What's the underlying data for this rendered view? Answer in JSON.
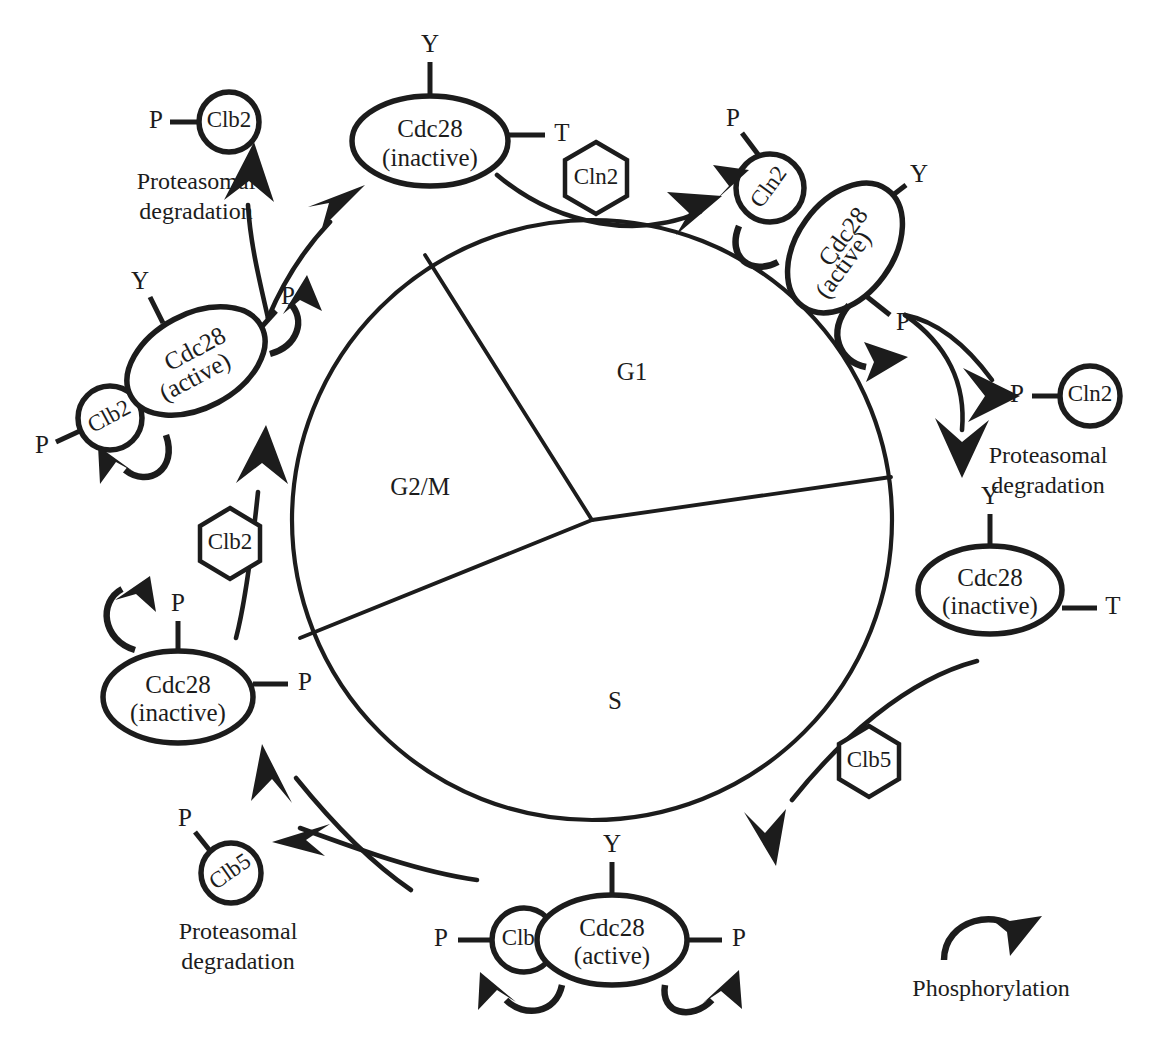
{
  "figure": {
    "type": "cell-cycle-regulation-diagram",
    "organism_cycle": "yeast cell cycle (Cdc28 / cyclin regulation)",
    "background_color": "#ffffff",
    "ink_color": "#1c1c1c"
  },
  "cycle_wheel": {
    "center": [
      592,
      520
    ],
    "radius": 300,
    "phases": [
      {
        "id": "g1",
        "label": "G1",
        "x": 632,
        "y": 374
      },
      {
        "id": "g2m",
        "label": "G2/M",
        "x": 420,
        "y": 489
      },
      {
        "id": "s",
        "label": "S",
        "x": 615,
        "y": 703
      }
    ],
    "divider_endpoints": [
      [
        425,
        255
      ],
      [
        891,
        477
      ],
      [
        300,
        638
      ]
    ]
  },
  "complexes": [
    {
      "id": "cdc28-inactive-top",
      "kinase_label": "Cdc28",
      "state_label": "(inactive)",
      "center": [
        430,
        141
      ],
      "rx": 78,
      "ry": 45,
      "rotate": 0,
      "residues": [
        {
          "label": "Y",
          "position": "top"
        },
        {
          "label": "T",
          "position": "right"
        }
      ],
      "cyclin": null
    },
    {
      "id": "cln2-cdc28-active",
      "kinase_label": "Cdc28",
      "state_label": "(active)",
      "center": [
        845,
        248
      ],
      "rx": 72,
      "ry": 48,
      "rotate": -54,
      "residues": [
        {
          "label": "Y",
          "position": "upper-right"
        },
        {
          "label": "P",
          "position": "lower-right"
        }
      ],
      "cyclin": {
        "label": "Cln2",
        "center": [
          770,
          188
        ],
        "r": 34,
        "tag": {
          "label": "P",
          "x": 735,
          "y": 123
        }
      }
    },
    {
      "id": "cdc28-inactive-right",
      "kinase_label": "Cdc28",
      "state_label": "(inactive)",
      "center": [
        990,
        590
      ],
      "rx": 72,
      "ry": 44,
      "rotate": 0,
      "residues": [
        {
          "label": "Y",
          "position": "top"
        },
        {
          "label": "T",
          "position": "right"
        }
      ],
      "cyclin": null
    },
    {
      "id": "clb5-cdc28-active",
      "kinase_label": "Cdc28",
      "state_label": "(active)",
      "center": [
        612,
        940
      ],
      "rx": 75,
      "ry": 45,
      "rotate": 0,
      "residues": [
        {
          "label": "Y",
          "position": "top"
        },
        {
          "label": "P",
          "position": "right"
        }
      ],
      "cyclin": {
        "label": "Clb5",
        "center": [
          524,
          940
        ],
        "r": 32,
        "tag": {
          "label": "P",
          "x": 440,
          "y": 940
        }
      }
    },
    {
      "id": "cdc28-inactive-left",
      "kinase_label": "Cdc28",
      "state_label": "(inactive)",
      "center": [
        178,
        697
      ],
      "rx": 75,
      "ry": 46,
      "rotate": 0,
      "residues": [
        {
          "label": "P",
          "position": "top"
        },
        {
          "label": "P",
          "position": "right"
        }
      ],
      "cyclin": null
    },
    {
      "id": "clb2-cdc28-active",
      "kinase_label": "Cdc28",
      "state_label": "(active)",
      "center": [
        196,
        361
      ],
      "rx": 74,
      "ry": 47,
      "rotate": -28,
      "residues": [
        {
          "label": "Y",
          "position": "upper-left"
        },
        {
          "label": "P",
          "position": "upper-right"
        }
      ],
      "cyclin": {
        "label": "Clb2",
        "center": [
          110,
          418
        ],
        "r": 32,
        "tag": {
          "label": "P",
          "x": 60,
          "y": 443
        }
      }
    }
  ],
  "cyclin_hexagons": [
    {
      "id": "hex-cln2",
      "label": "Cln2",
      "center": [
        596,
        178
      ],
      "r": 36
    },
    {
      "id": "hex-clb5",
      "label": "Clb5",
      "center": [
        869,
        761
      ],
      "r": 35
    },
    {
      "id": "hex-clb2",
      "label": "Clb2",
      "center": [
        230,
        543
      ],
      "r": 35
    }
  ],
  "degradation_products": [
    {
      "id": "deg-clb2",
      "cyclin": "Clb2",
      "center": [
        229,
        122
      ],
      "r": 30,
      "tag": {
        "label": "P",
        "x": 174,
        "y": 122
      },
      "caption": {
        "line1": "Proteasomal",
        "line2": "degradation",
        "x": 196,
        "y": 188
      }
    },
    {
      "id": "deg-cln2",
      "cyclin": "Cln2",
      "center": [
        1090,
        396
      ],
      "r": 30,
      "tag": {
        "label": "P",
        "x": 1030,
        "y": 396
      },
      "caption": {
        "line1": "Proteasomal",
        "line2": "degradation",
        "x": 1048,
        "y": 462
      }
    },
    {
      "id": "deg-clb5",
      "cyclin": "Clb5",
      "center": [
        231,
        873
      ],
      "r": 30,
      "tag": {
        "label": "P",
        "x": 190,
        "y": 837
      },
      "caption": {
        "line1": "Proteasomal",
        "line2": "degradation",
        "x": 238,
        "y": 938
      }
    }
  ],
  "legend": {
    "id": "legend-phosphorylation",
    "label": "Phosphorylation",
    "arc_center": [
      991,
      942
    ],
    "label_position": [
      991,
      989
    ]
  }
}
